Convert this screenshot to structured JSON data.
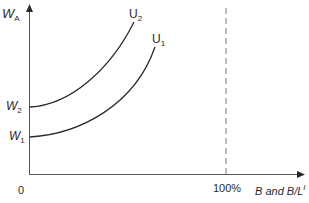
{
  "diagram": {
    "y_axis": {
      "label": "W",
      "label_sub": "A"
    },
    "x_axis": {
      "label": "B and B/L",
      "label_sup": "I",
      "origin": "0",
      "tick_100": "100%"
    },
    "curves": [
      {
        "name": "U",
        "sub": "2",
        "intercept_label": "W",
        "intercept_sub": "2"
      },
      {
        "name": "U",
        "sub": "1",
        "intercept_label": "W",
        "intercept_sub": "1"
      }
    ],
    "colors": {
      "line": "#2a2a2a",
      "dashed": "#777777"
    }
  }
}
